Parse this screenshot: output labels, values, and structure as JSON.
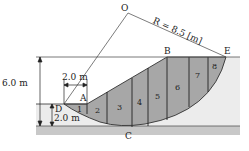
{
  "diagram": {
    "radius_label": "R = 8.5 [m]",
    "points": {
      "O": "O",
      "A": "A",
      "B": "B",
      "C": "C",
      "D": "D",
      "E": "E"
    },
    "dims": {
      "height": "6.0 m",
      "lower_depth": "2.0 m",
      "horizontal": "2.0 m"
    },
    "slices": [
      "1",
      "2",
      "3",
      "4",
      "5",
      "6",
      "7",
      "8"
    ],
    "colors": {
      "slice_fill": "#a7a7a7",
      "ground_fill": "#ececec",
      "base_fill": "#c8c8c8",
      "line": "#333333"
    }
  }
}
